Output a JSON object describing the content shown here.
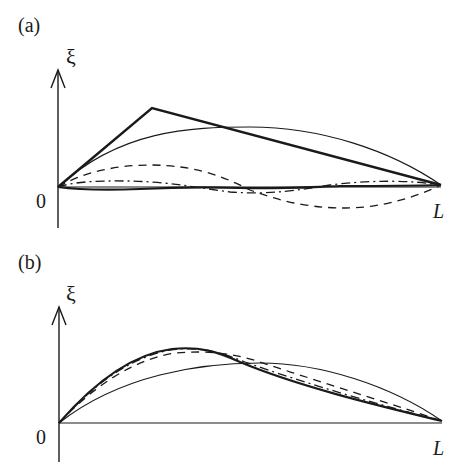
{
  "panels": [
    {
      "id": "a",
      "label": "(a)",
      "y_axis_label": "ξ",
      "origin_label": "0",
      "x_end_label": "L",
      "curves": [
        {
          "name": "initial-triangle",
          "style": "thick-solid",
          "description": "plucked string initial displacement, peak near x≈0.25L"
        },
        {
          "name": "fundamental-mode",
          "style": "thin-solid",
          "description": "half-sine arch, first normal mode"
        },
        {
          "name": "second-mode",
          "style": "dashed",
          "description": "one full sine wavelength"
        },
        {
          "name": "third-mode",
          "style": "dash-dot",
          "description": "small-amplitude higher mode"
        },
        {
          "name": "higher-mode",
          "style": "thick-solid",
          "description": "near-zero higher mode along axis"
        }
      ]
    },
    {
      "id": "b",
      "label": "(b)",
      "y_axis_label": "ξ",
      "origin_label": "0",
      "x_end_label": "L",
      "curves": [
        {
          "name": "fundamental-mode",
          "style": "thin-solid",
          "description": "half-sine arch"
        },
        {
          "name": "sum-two-modes",
          "style": "dashed",
          "description": "partial sum approximating triangle"
        },
        {
          "name": "sum-three-modes",
          "style": "dash-dot",
          "description": "partial sum"
        },
        {
          "name": "sum-many-modes",
          "style": "thick-solid",
          "description": "partial sum closely matching skewed shape"
        }
      ]
    }
  ],
  "colors": {
    "ink": "#1a1a1a",
    "background": "#ffffff"
  }
}
